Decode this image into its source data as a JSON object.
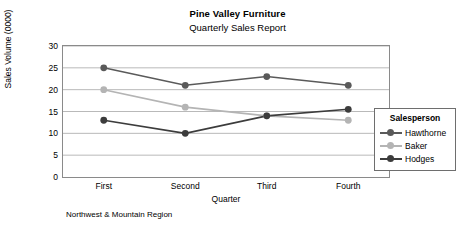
{
  "chart_data": {
    "type": "line",
    "title": "Pine Valley Furniture",
    "subtitle": "Quarterly Sales Report",
    "xlabel": "Quarter",
    "ylabel": "Sales Volume (0000)",
    "footnote": "Northwest & Mountain Region",
    "categories": [
      "First",
      "Second",
      "Third",
      "Fourth"
    ],
    "ylim": [
      0,
      30
    ],
    "yticks": [
      0,
      5,
      10,
      15,
      20,
      25,
      30
    ],
    "ytick_labels": [
      "0",
      "5",
      "10",
      "15",
      "20",
      "25",
      "30"
    ],
    "grid": true,
    "legend_position": "right",
    "legend_title": "Salesperson",
    "series": [
      {
        "name": "Hawthorne",
        "values": [
          25,
          21,
          23,
          21
        ],
        "color": "#5a5a5a"
      },
      {
        "name": "Baker",
        "values": [
          20,
          16,
          14,
          13
        ],
        "color": "#b4b4b4"
      },
      {
        "name": "Hodges",
        "values": [
          13,
          10,
          14,
          15.5
        ],
        "color": "#3c3c3c"
      }
    ]
  },
  "style": {
    "frame_color": "#8a8a8a",
    "grid_color": "#b9b9b9",
    "legend_border_color": "#6e6e6e",
    "background": "#ffffff",
    "text_color": "#000000"
  }
}
